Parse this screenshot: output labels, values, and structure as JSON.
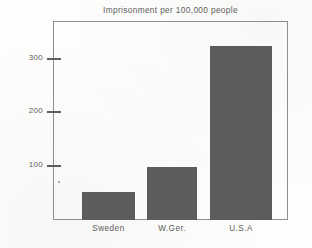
{
  "chart_data": {
    "type": "bar",
    "title": "Imprisonment per 100,000 people",
    "xlabel": "",
    "ylabel": "",
    "categories": [
      "Sweden",
      "W.Ger.",
      "U.S.A"
    ],
    "values": [
      52,
      98,
      324
    ],
    "ylim": [
      0,
      370
    ],
    "yticks": [
      100,
      200,
      300
    ],
    "ytick_labels": [
      "100",
      "200",
      "300"
    ],
    "grid": false,
    "legend": null,
    "bar_color": "#5c5c5c",
    "frame_color": "#8e8e8e",
    "text_color": "#5d5d5d",
    "background": "#fdfdfc"
  }
}
